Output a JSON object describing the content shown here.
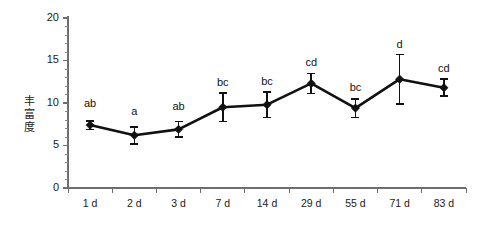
{
  "chart_data": {
    "type": "line",
    "title": "",
    "subtitle": "",
    "xlabel": "",
    "ylabel": "丰富度",
    "categories": [
      "1 d",
      "2 d",
      "3 d",
      "7 d",
      "14 d",
      "29 d",
      "55 d",
      "71 d",
      "83 d"
    ],
    "values": [
      7.4,
      6.2,
      6.9,
      9.5,
      9.8,
      12.3,
      9.4,
      12.8,
      11.8
    ],
    "errors": [
      0.5,
      1.0,
      0.9,
      1.7,
      1.5,
      1.2,
      1.1,
      2.9,
      1.0
    ],
    "annotations": [
      "ab",
      "a",
      "ab",
      "bc",
      "bc",
      "cd",
      "bc",
      "d",
      "cd"
    ],
    "ylim": [
      0,
      20
    ],
    "yticks": [
      0,
      5,
      10,
      15,
      20
    ],
    "ytick_labels": [
      "0",
      "5",
      "10",
      "15",
      "20"
    ],
    "y_minor_step": 1,
    "grid": false,
    "legend": "none",
    "marker": "diamond",
    "series": [
      {
        "name": "丰富度",
        "values": [
          7.4,
          6.2,
          6.9,
          9.5,
          9.8,
          12.3,
          9.4,
          12.8,
          11.8
        ],
        "errors": [
          0.5,
          1.0,
          0.9,
          1.7,
          1.5,
          1.2,
          1.1,
          2.9,
          1.0
        ]
      }
    ],
    "colors": {
      "line": "#111111",
      "marker": "#111111",
      "axis": "#6e6e6e",
      "text": "#1a1a1a",
      "background": "#ffffff"
    }
  }
}
